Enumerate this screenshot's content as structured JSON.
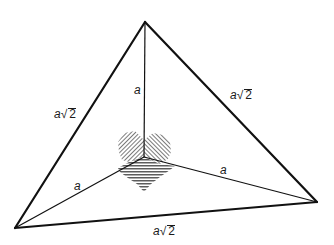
{
  "diagram": {
    "title": "",
    "colors": {
      "line": "#111111",
      "hatch": "#333333",
      "background": "#ffffff"
    },
    "vertices": {
      "top": [
        145,
        22
      ],
      "left": [
        15,
        228
      ],
      "right": [
        317,
        202
      ],
      "center": [
        144,
        157
      ]
    },
    "outer_edges": [
      {
        "from": "top",
        "to": "left",
        "label": "a√2",
        "label_pos": [
          55,
          108
        ]
      },
      {
        "from": "top",
        "to": "right",
        "label": "a√2",
        "label_pos": [
          230,
          88
        ]
      },
      {
        "from": "left",
        "to": "right",
        "label": "a√2",
        "label_pos": [
          153,
          224
        ]
      }
    ],
    "inner_edges": [
      {
        "from": "center",
        "to": "top",
        "label": "a",
        "label_pos": [
          133,
          84
        ]
      },
      {
        "from": "center",
        "to": "left",
        "label": "a",
        "label_pos": [
          72,
          178
        ]
      },
      {
        "from": "center",
        "to": "right",
        "label": "a",
        "label_pos": [
          218,
          163
        ]
      }
    ],
    "labels": {
      "outer_left": {
        "coef": "a",
        "radicand": "2"
      },
      "outer_right": {
        "coef": "a",
        "radicand": "2"
      },
      "outer_bottom": {
        "coef": "a",
        "radicand": "2"
      },
      "inner_top": "a",
      "inner_left": "a",
      "inner_right": "a"
    },
    "right_angle_hatching": [
      "top-left face",
      "top-right face",
      "bottom face"
    ]
  }
}
